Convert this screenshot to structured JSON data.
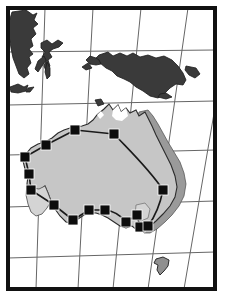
{
  "figure": {
    "kind": "map",
    "region_name": "Australia and surrounding region",
    "width": 234,
    "height": 298,
    "background_color": "#ffffff"
  },
  "frame": {
    "name": "map-border-frame",
    "x": 6,
    "y": 6,
    "width": 211,
    "height": 285,
    "stroke_color": "#111111",
    "stroke_width": 4,
    "fill_color": "#ffffff"
  },
  "graticule": {
    "name": "lat-lon-grid",
    "stroke_color": "#666666",
    "stroke_width": 1,
    "parallels": [
      {
        "label": "",
        "y_left": 52,
        "y_right": 50
      },
      {
        "label": "",
        "y_left": 105,
        "y_right": 101
      },
      {
        "label": "",
        "y_left": 155,
        "y_right": 150
      },
      {
        "label": "",
        "y_left": 207,
        "y_right": 201
      },
      {
        "label": "",
        "y_left": 258,
        "y_right": 252
      }
    ],
    "meridians": [
      {
        "label": "",
        "x_top": 45,
        "x_bottom": 36
      },
      {
        "label": "",
        "x_top": 93,
        "x_bottom": 78
      },
      {
        "label": "",
        "x_top": 141,
        "x_bottom": 113
      },
      {
        "label": "",
        "x_top": 188,
        "x_bottom": 148
      },
      {
        "label": "",
        "x_top": 232,
        "x_bottom": 184
      }
    ]
  },
  "landmasses": {
    "dark_color": "#3a3a3a",
    "dark_stroke": "#1c1c1c",
    "mainland_light_color": "#c6c6c6",
    "mainland_mid_color": "#9a9a9a",
    "mainland_stroke": "#2b2b2b",
    "items": [
      {
        "name": "borneo",
        "shade": "dark"
      },
      {
        "name": "sulawesi",
        "shade": "dark"
      },
      {
        "name": "java-lesser-sundas",
        "shade": "dark"
      },
      {
        "name": "new-guinea",
        "shade": "dark"
      },
      {
        "name": "new-britain",
        "shade": "dark"
      },
      {
        "name": "australia-mainland",
        "shade": "light"
      },
      {
        "name": "australia-eastern-highlands",
        "shade": "mid"
      },
      {
        "name": "tasmania",
        "shade": "mid"
      }
    ]
  },
  "route": {
    "name": "survey-transect-line",
    "stroke_color": "#1a1a1a",
    "stroke_width": 1.6,
    "description": "line connecting sample site markers"
  },
  "markers": {
    "name": "sample-site-markers",
    "shape": "square",
    "fill_color": "#0d0d0d",
    "stroke_color": "#ffffff",
    "size": 10,
    "count": 15,
    "points": [
      {
        "id": "m01",
        "x": 75,
        "y": 130,
        "label": ""
      },
      {
        "id": "m02",
        "x": 114,
        "y": 134,
        "label": ""
      },
      {
        "id": "m03",
        "x": 46,
        "y": 145,
        "label": ""
      },
      {
        "id": "m04",
        "x": 25,
        "y": 157,
        "label": ""
      },
      {
        "id": "m05",
        "x": 29,
        "y": 174,
        "label": ""
      },
      {
        "id": "m06",
        "x": 31,
        "y": 190,
        "label": ""
      },
      {
        "id": "m07",
        "x": 54,
        "y": 205,
        "label": ""
      },
      {
        "id": "m08",
        "x": 73,
        "y": 220,
        "label": ""
      },
      {
        "id": "m09",
        "x": 89,
        "y": 210,
        "label": ""
      },
      {
        "id": "m10",
        "x": 105,
        "y": 210,
        "label": ""
      },
      {
        "id": "m11",
        "x": 126,
        "y": 222,
        "label": ""
      },
      {
        "id": "m12",
        "x": 137,
        "y": 215,
        "label": ""
      },
      {
        "id": "m13",
        "x": 140,
        "y": 227,
        "label": ""
      },
      {
        "id": "m14",
        "x": 163,
        "y": 190,
        "label": ""
      },
      {
        "id": "m15",
        "x": 148,
        "y": 226,
        "label": ""
      }
    ]
  }
}
